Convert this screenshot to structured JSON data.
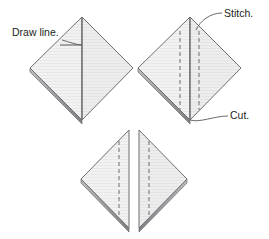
{
  "figure": {
    "background_color": "#ffffff",
    "width": 269,
    "height": 239
  },
  "style": {
    "fabric_fill": "#f1f1f1",
    "fabric_fill_light": "#f7f7f7",
    "fabric_fill_shade": "#ebebeb",
    "outline_color": "#6d6e70",
    "edge_band_color": "#a7a9ac",
    "edge_band_dark": "#808285",
    "dashed_line_color": "#808285",
    "leader_line_color": "#58595b",
    "text_color": "#231f20",
    "texture_line_color": "#e2e2e2"
  },
  "labels": [
    {
      "id": "draw-line",
      "text": "Draw line.",
      "x": 12,
      "y": 36,
      "anchor": "start"
    },
    {
      "id": "stitch",
      "text": "Stitch.",
      "x": 224,
      "y": 17,
      "anchor": "start"
    },
    {
      "id": "cut",
      "text": "Cut.",
      "x": 230,
      "y": 119,
      "anchor": "start"
    }
  ],
  "shapes": [
    {
      "id": "diamond-draw-line",
      "name": "folded-square-with-drawn-line",
      "kind": "diamond",
      "apex": {
        "x": 82,
        "y": 17
      },
      "left": {
        "x": 30,
        "y": 68
      },
      "bottom": {
        "x": 82,
        "y": 120
      },
      "right": {
        "x": 133,
        "y": 68
      },
      "center_fold_line": true,
      "dashed_lines": [],
      "marked_line": {
        "from_x": 60,
        "from_y": 45,
        "to_x": 82,
        "to_y": 45
      }
    },
    {
      "id": "diamond-stitch-cut",
      "name": "folded-square-with-stitch-lines",
      "kind": "diamond",
      "apex": {
        "x": 190,
        "y": 17
      },
      "left": {
        "x": 138,
        "y": 68
      },
      "bottom": {
        "x": 190,
        "y": 120
      },
      "right": {
        "x": 241,
        "y": 68
      },
      "center_fold_line": true,
      "dashed_lines": [
        {
          "x": 180
        },
        {
          "x": 199
        }
      ],
      "marked_line": null
    },
    {
      "id": "triangle-left",
      "name": "cut-triangle-left",
      "kind": "triangle",
      "points": [
        {
          "x": 129,
          "y": 130
        },
        {
          "x": 81,
          "y": 179
        },
        {
          "x": 129,
          "y": 228
        }
      ],
      "dashed_line": {
        "x": 119,
        "y1": 140,
        "y2": 220
      }
    },
    {
      "id": "triangle-right",
      "name": "cut-triangle-right",
      "kind": "triangle",
      "points": [
        {
          "x": 139,
          "y": 130
        },
        {
          "x": 187,
          "y": 179
        },
        {
          "x": 139,
          "y": 228
        }
      ],
      "dashed_line": {
        "x": 149,
        "y1": 140,
        "y2": 220
      }
    }
  ],
  "leaders": [
    {
      "id": "leader-draw-line",
      "for_label": "draw-line",
      "path": "M 62,40 C 70,42 76,45 82,45",
      "from_label_edge": {
        "x": 62,
        "y": 40
      },
      "to_point": {
        "x": 82,
        "y": 45
      }
    },
    {
      "id": "leader-stitch",
      "for_label": "stitch",
      "path": "M 222,13 C 210,13 200,22 196,30",
      "from_label_edge": {
        "x": 222,
        "y": 13
      },
      "to_point": {
        "x": 196,
        "y": 30
      }
    },
    {
      "id": "leader-cut",
      "for_label": "cut",
      "path": "M 228,116 C 214,116 200,122 190,120",
      "from_label_edge": {
        "x": 228,
        "y": 116
      },
      "to_point": {
        "x": 190,
        "y": 120
      }
    }
  ]
}
